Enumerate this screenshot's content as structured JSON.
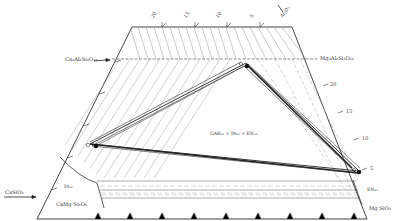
{
  "diagram": {
    "type": "ternary-phase-diagram-section",
    "components": {
      "top_right_apex": "Al2O3",
      "bottom_left": "CaSiO3",
      "bottom_right": "MgSiO3",
      "bottom_left_join": "CaMg Si2O6"
    },
    "labels": {
      "al2o3": "Al₂O₃",
      "grossular": "Ca₃Al₂Si₃O₁₂",
      "pyrope": "Mg₃Al₂Si₃O₁₂",
      "casio3": "CaSiO₃",
      "camgsi2o6": "CaMg Si₂O₆",
      "mgsio3": "Mg SiO₃",
      "field_center": "GAR₁₁ + Di₁₁ + EN₁₁",
      "field_di": "Di₁₁",
      "field_en": "EN₁₁"
    },
    "top_ticks": [
      "20",
      "15",
      "10",
      "5"
    ],
    "right_ticks": [
      "20",
      "15",
      "10",
      "5"
    ],
    "bottom_ticks": [
      "55",
      "60",
      "65",
      "70",
      "75",
      "80",
      "85",
      "90",
      "95"
    ],
    "colors": {
      "line": "#333333",
      "hatch": "#888888",
      "background": "#ffffff"
    }
  }
}
